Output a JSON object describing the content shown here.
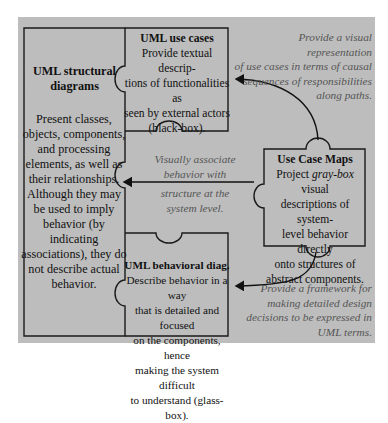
{
  "diagram": {
    "structural": {
      "title_lines": [
        "UML structural",
        "diagrams"
      ],
      "body_lines": [
        "Present classes,",
        "objects, components,",
        "and processing",
        "elements, as well as",
        "their relationships.",
        "Although they may",
        "be used to imply",
        "behavior (by",
        "indicating",
        "associations), they do",
        "not describe actual",
        "behavior."
      ]
    },
    "use_cases": {
      "title": "UML use cases",
      "body_lines": [
        "Provide textual descrip-",
        "tions of functionalities as",
        "seen by external actors",
        "(black-box)."
      ]
    },
    "behavioral": {
      "title": "UML behavioral diag.",
      "body_lines": [
        "Describe behavior in a way",
        "that is detailed and focused",
        "on the components, hence",
        "making the system difficult",
        "to understand (glass-box)."
      ]
    },
    "ucm": {
      "title": "Use Case Maps",
      "line1_pre": "Project ",
      "line1_em": "gray-box",
      "line1_post": " visual",
      "body_lines": [
        "descriptions of system-",
        "level behavior directly",
        "onto structures of",
        "abstract components."
      ]
    },
    "notes": {
      "top": [
        "Provide a visual representation",
        "of use cases in terms of causal",
        "sequences of responsibilities",
        "along paths."
      ],
      "middle": [
        "Visually associate",
        "behavior with",
        "structure at the",
        "system level."
      ],
      "bottom": [
        "Provide a framework for",
        "making detailed  design",
        "decisions to be expressed in",
        "UML terms."
      ]
    },
    "colors": {
      "background": "#bdbdbd",
      "border": "#1a1a1a",
      "note_text": "#555555"
    }
  }
}
